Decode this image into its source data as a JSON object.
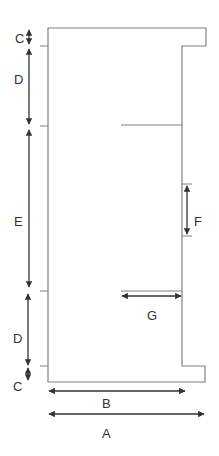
{
  "diagram": {
    "type": "dimensioned cross-section outline",
    "labels": {
      "A": "A",
      "B": "B",
      "C_top": "C",
      "C_bottom": "C",
      "D_top": "D",
      "D_bottom": "D",
      "E": "E",
      "F": "F",
      "G": "G"
    },
    "colors": {
      "outline": "#808080",
      "arrow": "#333333",
      "text": "#333333",
      "background": "#ffffff"
    }
  }
}
